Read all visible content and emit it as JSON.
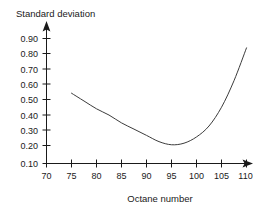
{
  "chart_data": {
    "type": "line",
    "title": "",
    "xlabel": "Octane number",
    "ylabel": "Standard deviation",
    "xlim": [
      70,
      110
    ],
    "ylim": [
      0.1,
      0.9
    ],
    "grid": false,
    "legend": false,
    "xticks": [
      "70",
      "75",
      "80",
      "85",
      "90",
      "95",
      "100",
      "105",
      "110"
    ],
    "yticks": [
      "0.10",
      "0.20",
      "0.30",
      "0.40",
      "0.50",
      "0.60",
      "0.70",
      "0.80",
      "0.90"
    ],
    "series": [
      {
        "name": "Standard deviation vs octane number",
        "x": [
          75,
          77.5,
          80,
          82.5,
          85,
          87.5,
          90,
          92.5,
          95,
          97.5,
          100,
          102.5,
          105,
          107.5,
          110
        ],
        "values": [
          0.55,
          0.5,
          0.45,
          0.41,
          0.36,
          0.32,
          0.28,
          0.24,
          0.22,
          0.23,
          0.27,
          0.34,
          0.46,
          0.63,
          0.84
        ]
      }
    ],
    "annotations": {
      "minimum_value": 0.22,
      "minimum_at_x": 94
    },
    "style": {
      "line_color": "#3c3c3c",
      "axis_color": "#1a1a1a",
      "background": "#ffffff"
    }
  },
  "axes": {
    "y_axis_label": "Standard deviation",
    "x_axis_label": "Octane number"
  }
}
